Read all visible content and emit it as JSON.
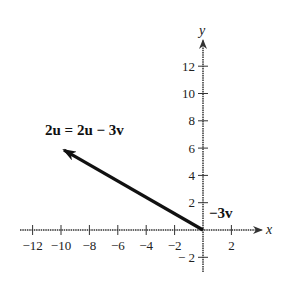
{
  "figure": {
    "x_axis_label": "x",
    "y_axis_label": "y",
    "x_ticks": [
      {
        "value": -12,
        "label": "−12"
      },
      {
        "value": -10,
        "label": "−10"
      },
      {
        "value": -8,
        "label": "−8"
      },
      {
        "value": -6,
        "label": "−6"
      },
      {
        "value": -4,
        "label": "−4"
      },
      {
        "value": -2,
        "label": "−2"
      },
      {
        "value": 2,
        "label": "2"
      }
    ],
    "y_ticks": [
      {
        "value": 12,
        "label": "12"
      },
      {
        "value": 10,
        "label": "10"
      },
      {
        "value": 8,
        "label": "8"
      },
      {
        "value": 6,
        "label": "6"
      },
      {
        "value": 4,
        "label": "4"
      },
      {
        "value": 2,
        "label": "2"
      },
      {
        "value": -2,
        "label": "− 2"
      }
    ],
    "vectors": [
      {
        "name": "result-vector",
        "from": [
          0,
          0
        ],
        "to": [
          -10,
          6
        ],
        "label": "2u = 2u − 3v"
      }
    ],
    "annotations": [
      {
        "name": "minus-3v-label",
        "text": "−3v",
        "at": [
          0.4,
          1.2
        ]
      }
    ],
    "xlim": [
      -13,
      4
    ],
    "ylim": [
      -3,
      14
    ]
  }
}
